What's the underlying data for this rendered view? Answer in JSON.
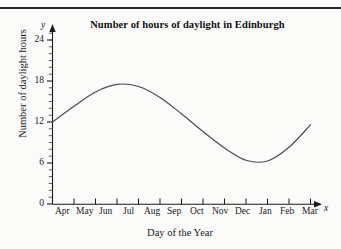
{
  "figure": {
    "title": "Number of hours of daylight in Edinburgh",
    "x_axis_label": "Day of the Year",
    "y_axis_label": "Number of daylight hours",
    "y_axis_letter": "y",
    "x_axis_letter": "x",
    "line_color": "#4a4a4a",
    "axis_color": "#1a1a1a",
    "background_color": "#fbfbfa",
    "rule_color": "#262626"
  },
  "chart_data": {
    "type": "line",
    "title": "Number of hours of daylight in Edinburgh",
    "xlabel": "Day of the Year",
    "ylabel": "Number of daylight hours",
    "categories": [
      "Apr",
      "May",
      "Jun",
      "Jul",
      "Aug",
      "Sep",
      "Oct",
      "Nov",
      "Dec",
      "Jan",
      "Feb",
      "Mar"
    ],
    "x_tick_labels": [
      "Apr",
      "May",
      "Jun",
      "Jul",
      "Aug",
      "Sep",
      "Oct",
      "Nov",
      "Dec",
      "Jan",
      "Feb",
      "Mar"
    ],
    "y_tick_labels": [
      "0",
      "6",
      "12",
      "18",
      "24"
    ],
    "y_tick_values": [
      0,
      6,
      12,
      18,
      24
    ],
    "y_minor_tick_interval": 1,
    "ylim": [
      0,
      24
    ],
    "xlim": [
      0,
      12
    ],
    "grid": false,
    "legend": false,
    "series": [
      {
        "name": "Hours of daylight",
        "x": [
          0,
          1,
          2,
          3,
          4,
          5,
          6,
          7,
          8,
          9,
          10,
          11,
          12
        ],
        "values": [
          12.0,
          14.3,
          16.4,
          17.5,
          17.2,
          15.6,
          13.2,
          10.6,
          8.2,
          6.4,
          6.3,
          8.3,
          11.6
        ]
      }
    ],
    "annotations": {
      "start_value": 12.0,
      "peak_value": 17.5,
      "peak_month": "Jun",
      "trough_value": 6.2,
      "trough_month": "Dec",
      "end_value": 11.6
    }
  },
  "ytick_labels": [
    {
      "text": "24",
      "top": 34
    },
    {
      "text": "18",
      "top": 75
    },
    {
      "text": "12",
      "top": 116
    },
    {
      "text": "6",
      "top": 157
    },
    {
      "text": "0",
      "top": 198
    }
  ],
  "xtick_labels": [
    {
      "text": "Apr",
      "left": 55
    },
    {
      "text": "May",
      "left": 76
    },
    {
      "text": "Jun",
      "left": 99
    },
    {
      "text": "Jul",
      "left": 123
    },
    {
      "text": "Aug",
      "left": 144
    },
    {
      "text": "Sep",
      "left": 167
    },
    {
      "text": "Oct",
      "left": 190
    },
    {
      "text": "Nov",
      "left": 212
    },
    {
      "text": "Dec",
      "left": 235
    },
    {
      "text": "Jan",
      "left": 259
    },
    {
      "text": "Feb",
      "left": 280
    },
    {
      "text": "Mar",
      "left": 302
    }
  ]
}
